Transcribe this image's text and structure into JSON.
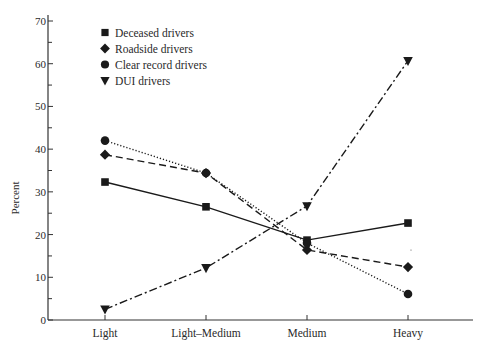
{
  "chart_data": {
    "type": "line",
    "title": "",
    "xlabel": "",
    "ylabel": "Percent",
    "ylim": [
      0,
      70
    ],
    "yticks": [
      0,
      10,
      20,
      30,
      40,
      50,
      60,
      70
    ],
    "grid": false,
    "legend_position": "upper-left inside",
    "categories": [
      "Light",
      "Light–Medium",
      "Medium",
      "Heavy"
    ],
    "series": [
      {
        "name": "Deceased drivers",
        "marker": "square",
        "line_style": "solid",
        "values": [
          32.3,
          26.5,
          18.7,
          22.7
        ]
      },
      {
        "name": "Roadside drivers",
        "marker": "diamond",
        "line_style": "dashed",
        "values": [
          38.7,
          34.4,
          16.4,
          12.4
        ]
      },
      {
        "name": "Clear record drivers",
        "marker": "circle",
        "line_style": "dotted",
        "values": [
          42.0,
          34.4,
          18.0,
          6.1
        ]
      },
      {
        "name": "DUI drivers",
        "marker": "triangle-down",
        "line_style": "dash-dot",
        "values": [
          2.5,
          12.2,
          26.7,
          60.7
        ]
      }
    ]
  },
  "colors": {
    "ink": "#1a1a1a",
    "axis": "#333333",
    "background": "#ffffff"
  }
}
